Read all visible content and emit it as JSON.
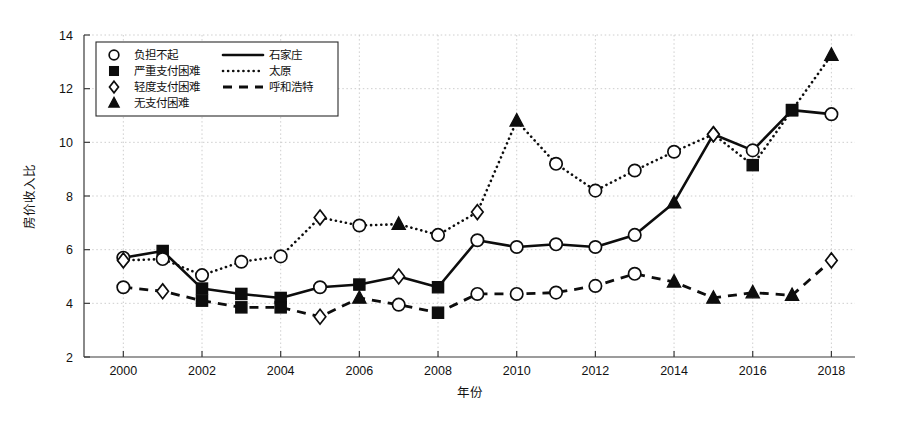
{
  "chart_data": {
    "type": "line",
    "title": "",
    "xlabel": "年份",
    "ylabel": "房价收入比",
    "xlim": [
      1999,
      2018.6
    ],
    "ylim": [
      2,
      14
    ],
    "xticks": [
      2000,
      2002,
      2004,
      2006,
      2008,
      2010,
      2012,
      2014,
      2016,
      2018
    ],
    "yticks": [
      2,
      4,
      6,
      8,
      10,
      12,
      14
    ],
    "grid": true,
    "legend_position": "top-left",
    "x": [
      2000,
      2001,
      2002,
      2003,
      2004,
      2005,
      2006,
      2007,
      2008,
      2009,
      2010,
      2011,
      2012,
      2013,
      2014,
      2015,
      2016,
      2017,
      2018
    ],
    "series": [
      {
        "name": "石家庄",
        "linestyle": "solid",
        "values": [
          5.7,
          5.95,
          4.55,
          4.35,
          4.2,
          4.6,
          4.7,
          5.0,
          4.6,
          6.35,
          6.1,
          6.2,
          6.1,
          6.55,
          7.75,
          10.3,
          9.7,
          11.2,
          11.05
        ],
        "markers": [
          "circle-open",
          "square-filled",
          "square-filled",
          "square-filled",
          "square-filled",
          "circle-open",
          "square-filled",
          "diamond-open",
          "square-filled",
          "circle-open",
          "circle-open",
          "circle-open",
          "circle-open",
          "circle-open",
          "triangle-filled",
          "diamond-open",
          "circle-open",
          "square-filled",
          "circle-open"
        ]
      },
      {
        "name": "太原",
        "linestyle": "dotted",
        "values": [
          5.6,
          5.65,
          5.05,
          5.55,
          5.75,
          7.2,
          6.9,
          6.95,
          6.55,
          7.4,
          10.8,
          9.2,
          8.2,
          8.95,
          9.65,
          10.3,
          9.15,
          11.2,
          13.25
        ],
        "markers": [
          "diamond-open",
          "circle-open",
          "circle-open",
          "circle-open",
          "circle-open",
          "diamond-open",
          "circle-open",
          "triangle-filled",
          "circle-open",
          "diamond-open",
          "triangle-filled",
          "circle-open",
          "circle-open",
          "circle-open",
          "circle-open",
          "diamond-open",
          "square-filled",
          "square-filled",
          "triangle-filled"
        ]
      },
      {
        "name": "呼和浩特",
        "linestyle": "dashed",
        "values": [
          4.6,
          4.45,
          4.1,
          3.85,
          3.85,
          3.5,
          4.2,
          3.95,
          3.65,
          4.35,
          4.35,
          4.4,
          4.65,
          5.1,
          4.8,
          4.2,
          4.4,
          4.3,
          5.6
        ],
        "markers": [
          "circle-open",
          "diamond-open",
          "square-filled",
          "square-filled",
          "square-filled",
          "diamond-open",
          "triangle-filled",
          "circle-open",
          "square-filled",
          "circle-open",
          "circle-open",
          "circle-open",
          "circle-open",
          "circle-open",
          "triangle-filled",
          "triangle-filled",
          "triangle-filled",
          "triangle-filled",
          "diamond-open"
        ]
      }
    ],
    "marker_legend": [
      {
        "marker": "circle-open",
        "label": "负担不起"
      },
      {
        "marker": "square-filled",
        "label": "严重支付困难"
      },
      {
        "marker": "diamond-open",
        "label": "轻度支付困难"
      },
      {
        "marker": "triangle-filled",
        "label": "无支付困难"
      }
    ],
    "line_legend": [
      {
        "linestyle": "solid",
        "label": "石家庄"
      },
      {
        "linestyle": "dotted",
        "label": "太原"
      },
      {
        "linestyle": "dashed",
        "label": "呼和浩特"
      }
    ],
    "colors": {
      "line": "#0d0d0d",
      "grid": "#c8c8c8",
      "axis": "#3a3a3a",
      "background": "#ffffff"
    }
  }
}
